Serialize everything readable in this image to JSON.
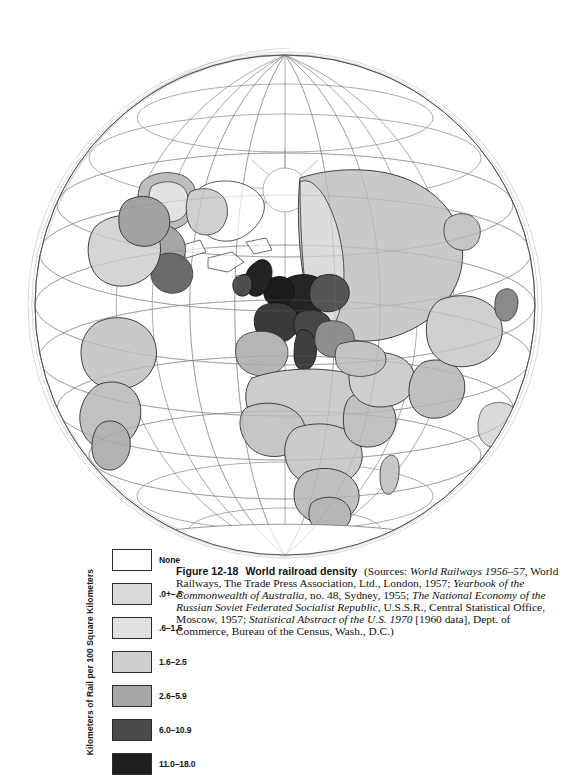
{
  "figure": {
    "number": "Figure 12-18",
    "title": "World railroad density",
    "sources_prefix": "(Sources:",
    "sources": [
      {
        "text": "World Railways 1956–57,",
        "italic": true
      },
      {
        "text": " World Railways, The Trade Press Association, Ltd., London, 1957; ",
        "italic": false
      },
      {
        "text": "Yearbook of the Commonwealth of Australia,",
        "italic": true
      },
      {
        "text": " no. 48, Sydney, 1955; ",
        "italic": false
      },
      {
        "text": "The National Economy of the Russian Soviet Federated Socialist Republic,",
        "italic": true
      },
      {
        "text": " U.S.S.R., Central Statistical Office, Moscow, 1957; ",
        "italic": false
      },
      {
        "text": "Statistical Abstract of the U.S. 1970",
        "italic": true
      },
      {
        "text": " [1960 data], Dept. of Commerce, Bureau of the Census, Wash., D.C.)",
        "italic": false
      }
    ],
    "full_caption": "Figure 12-18 World railroad density  (Sources: World Railways 1956–57, World Railways, The Trade Press Association, Ltd., London, 1957; Yearbook of the Commonwealth of Australia, no. 48, Sydney, 1955; The National Economy of the Russian Soviet Federated Socialist Republic, U.S.S.R., Central Statistical Office, Moscow, 1957; Statistical Abstract of the U.S. 1970 [1960 data], Dept. of Commerce, Bureau of the Census, Wash., D.C.)"
  },
  "legend": {
    "axis_label": "Kilometers of Rail per 100 Square Kilometers",
    "classes": [
      {
        "label": "None",
        "color": "#ffffff"
      },
      {
        "label": ".0+–.5",
        "color": "#d9d9d9"
      },
      {
        "label": ".6–1.5",
        "color": "#e2e2e2"
      },
      {
        "label": "1.6–2.5",
        "color": "#cfcfcf"
      },
      {
        "label": "2.6–5.9",
        "color": "#a6a6a6"
      },
      {
        "label": "6.0–10.9",
        "color": "#4a4a4a"
      },
      {
        "label": "11.0–18.0",
        "color": "#1e1e1e"
      }
    ]
  },
  "map": {
    "projection": "orthographic globe",
    "center_hint": "Europe / Africa / North Pole visible",
    "graticule": {
      "visible": true,
      "color": "#7a7a7a"
    },
    "outline_color": "#2e2e2e",
    "regions": [
      {
        "name": "united-kingdom",
        "class": 6
      },
      {
        "name": "ireland",
        "class": 5
      },
      {
        "name": "belgium-netherlands",
        "class": 6
      },
      {
        "name": "germany",
        "class": 6
      },
      {
        "name": "france",
        "class": 5
      },
      {
        "name": "switzerland-austria",
        "class": 5
      },
      {
        "name": "italy",
        "class": 5
      },
      {
        "name": "poland-czechoslovakia",
        "class": 5
      },
      {
        "name": "hungary-balkans",
        "class": 4
      },
      {
        "name": "denmark",
        "class": 5
      },
      {
        "name": "spain-portugal",
        "class": 3
      },
      {
        "name": "scandinavia",
        "class": 3
      },
      {
        "name": "norway-sweden-north",
        "class": 4
      },
      {
        "name": "ussr-european",
        "class": 2
      },
      {
        "name": "ussr-siberia",
        "class": 1
      },
      {
        "name": "greenland",
        "class": 0
      },
      {
        "name": "canada-east",
        "class": 4
      },
      {
        "name": "north-america-west",
        "class": 2
      },
      {
        "name": "north-africa",
        "class": 1
      },
      {
        "name": "sub-saharan-africa",
        "class": 1
      },
      {
        "name": "south-africa",
        "class": 2
      },
      {
        "name": "middle-east",
        "class": 1
      },
      {
        "name": "india",
        "class": 2
      },
      {
        "name": "south-america-east",
        "class": 2
      },
      {
        "name": "south-america-west",
        "class": 1
      },
      {
        "name": "japan",
        "class": 4
      },
      {
        "name": "china",
        "class": 1
      },
      {
        "name": "madagascar",
        "class": 1
      },
      {
        "name": "antarctica",
        "class": 0
      }
    ]
  }
}
